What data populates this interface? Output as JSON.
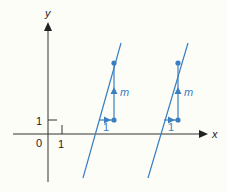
{
  "diagram": {
    "title": "",
    "axes": {
      "x_label": "x",
      "y_label": "y",
      "origin_label": "0",
      "x_unit_label": "1",
      "y_unit_label": "1"
    },
    "lines": [
      {
        "name": "line-1",
        "description": "straight line with gradient m"
      },
      {
        "name": "line-2",
        "description": "parallel straight line with gradient m"
      }
    ],
    "slope_triangles": [
      {
        "run_label": "1",
        "rise_label": "m"
      },
      {
        "run_label": "1",
        "rise_label": "m"
      }
    ],
    "colors": {
      "axis": "#222222",
      "line": "#3a7fc1",
      "background": "#fdfdf8"
    }
  }
}
